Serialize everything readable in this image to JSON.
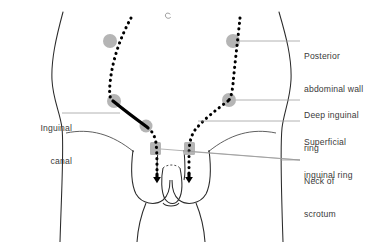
{
  "figure": {
    "type": "anatomical-diagram",
    "background_color": "#ffffff",
    "outline_color": "#2b2b2b",
    "marker_color": "#b3b3b3",
    "path_color": "#000000",
    "leader_color": "#9a9a9a",
    "text_color": "#3a3a3a"
  },
  "labels": {
    "inguinal_canal": {
      "line1": "Inguinal",
      "line2": "canal"
    },
    "posterior_abdominal_wall": {
      "line1": "Posterior",
      "line2": "abdominal wall"
    },
    "deep_inguinal_ring": {
      "line1": "Deep inguinal",
      "line2": "ring"
    },
    "superficial_inguinal_ring": {
      "line1": "Superficial",
      "line2": "inguinal ring"
    },
    "neck_of_scrotum": {
      "line1": "Neck of",
      "line2": "scrotum"
    }
  },
  "anatomy": {
    "umbilicus": "navel-mark",
    "left_body_outline": "torso-hip-contour-left",
    "right_body_outline": "torso-hip-contour-right",
    "scrotum": "scrotal-sac",
    "penis": "penis-outline",
    "thighs": "inner-thigh-lines"
  },
  "descent_paths": {
    "left": {
      "style": "dotted-with-solid-canal-segment",
      "direction": "downward",
      "markers": [
        "deep-inguinal-ring",
        "canal-entry",
        "superficial-inguinal-ring",
        "neck-of-scrotum"
      ]
    },
    "right": {
      "style": "dotted",
      "direction": "downward",
      "markers": [
        "deep-inguinal-ring",
        "superficial-inguinal-ring",
        "neck-of-scrotum"
      ]
    }
  }
}
